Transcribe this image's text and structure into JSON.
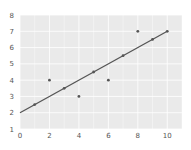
{
  "chart_data": {
    "type": "scatter",
    "title": "",
    "xlabel": "",
    "ylabel": "",
    "xlim": [
      0,
      11
    ],
    "ylim": [
      1,
      8
    ],
    "grid": true,
    "legend": null,
    "x_ticks": [
      0,
      2,
      4,
      6,
      8,
      10
    ],
    "y_ticks": [
      1,
      2,
      3,
      4,
      5,
      6,
      7,
      8
    ],
    "series": [
      {
        "name": "points",
        "kind": "scatter",
        "x": [
          1,
          2,
          3,
          4,
          5,
          6,
          7,
          8,
          9,
          10
        ],
        "y": [
          2.5,
          4,
          3.5,
          3,
          4.5,
          4,
          5.5,
          7,
          6.5,
          7
        ],
        "color": "#555555"
      },
      {
        "name": "fit-line",
        "kind": "line",
        "x": [
          0,
          10
        ],
        "y": [
          2,
          7
        ],
        "color": "#555555"
      }
    ]
  },
  "style": {
    "plot_bg": "#eaeaea",
    "grid_color": "#ffffff",
    "marker_color": "#555555",
    "line_color": "#555555"
  }
}
